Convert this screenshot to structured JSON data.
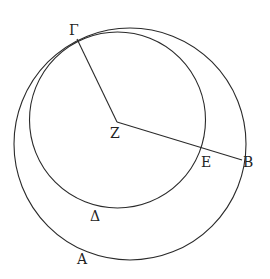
{
  "diagram": {
    "labels": {
      "gamma": "Γ",
      "zeta": "Z",
      "epsilon": "E",
      "beta": "B",
      "delta": "Δ",
      "alpha": "A"
    },
    "stroke_color": "#2a2a2a",
    "background": "#ffffff"
  }
}
